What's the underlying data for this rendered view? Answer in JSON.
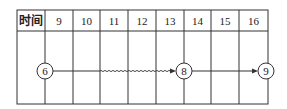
{
  "diagram": {
    "type": "time-scaled network diagram",
    "header": {
      "time_label": "时间",
      "time_ticks": [
        "9",
        "10",
        "11",
        "12",
        "13",
        "14",
        "15",
        "16"
      ]
    },
    "nodes": [
      {
        "id": "n6",
        "label": "6",
        "time": 9
      },
      {
        "id": "n8",
        "label": "8",
        "time": 14
      },
      {
        "id": "n9",
        "label": "9",
        "time": 17
      }
    ],
    "edges": [
      {
        "from": "6",
        "to": "8",
        "solid_from": 9,
        "solid_to": 11,
        "wavy_from": 11,
        "wavy_to": 14,
        "note": "work arrow with free float shown as wavy line"
      },
      {
        "from": "8",
        "to": "9",
        "solid_from": 14,
        "solid_to": 17
      }
    ],
    "colors": {
      "line": "#333333",
      "background": "#ffffff"
    }
  }
}
